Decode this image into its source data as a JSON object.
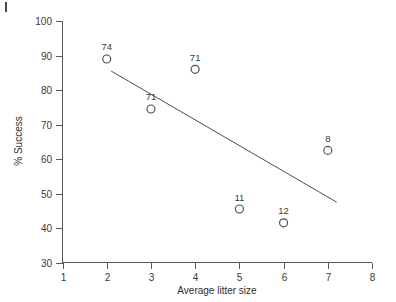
{
  "chart_data": {
    "type": "scatter",
    "title": "",
    "xlabel": "Average litter size",
    "ylabel": "% Success",
    "xlim": [
      1,
      8
    ],
    "ylim": [
      30,
      100
    ],
    "xticks": [
      1,
      2,
      3,
      4,
      5,
      6,
      7,
      8
    ],
    "yticks": [
      30,
      40,
      50,
      60,
      70,
      80,
      90,
      100
    ],
    "xtick_labels": [
      "1",
      "2",
      "3",
      "4",
      "5",
      "6",
      "7",
      "8"
    ],
    "ytick_labels": [
      "30",
      "40",
      "50",
      "60",
      "70",
      "80",
      "90",
      "100"
    ],
    "grid": false,
    "legend": "none",
    "marker": "open-circle",
    "points": [
      {
        "x": 2,
        "y": 89.0,
        "label": "74"
      },
      {
        "x": 3,
        "y": 74.5,
        "label": "71"
      },
      {
        "x": 4,
        "y": 86.0,
        "label": "71"
      },
      {
        "x": 5,
        "y": 45.5,
        "label": "11"
      },
      {
        "x": 6,
        "y": 41.5,
        "label": "12"
      },
      {
        "x": 7,
        "y": 62.5,
        "label": "8"
      }
    ],
    "trendline": {
      "type": "line",
      "x": [
        2.1,
        7.2
      ],
      "y": [
        85.5,
        47.5
      ]
    },
    "colors": {
      "axis": "#5a5a5a",
      "marker": "#4d4d4d",
      "line": "#4d4d4d",
      "text": "#3a3a3a",
      "background": "#ffffff"
    }
  }
}
